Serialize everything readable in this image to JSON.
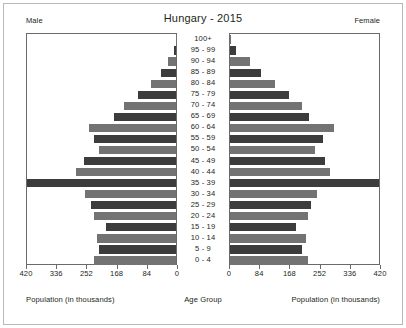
{
  "header": {
    "title": "Hungary - 2015",
    "left_label": "Male",
    "right_label": "Female"
  },
  "captions": {
    "left": "Population (in thousands)",
    "center": "Age Group",
    "right": "Population (in thousands)"
  },
  "axis": {
    "left_ticks": [
      "420",
      "336",
      "252",
      "168",
      "84",
      "0"
    ],
    "right_ticks": [
      "0",
      "84",
      "168",
      "252",
      "336",
      "420"
    ],
    "max": 420,
    "tick_step": 84
  },
  "colors": {
    "bar_dark": "#3c3c3c",
    "bar_light": "#737373",
    "frame": "#6a6a6a",
    "outer_border": "#b9b9b9",
    "background": "#ffffff",
    "text": "#231f20"
  },
  "chart_data": {
    "type": "bar",
    "subtype": "population-pyramid",
    "title": "Hungary - 2015",
    "xlabel": "Population (in thousands)",
    "ylabel": "Age Group",
    "unit": "thousands",
    "xlim": [
      0,
      420
    ],
    "grid": false,
    "legend": [
      "Male",
      "Female"
    ],
    "legend_position": "top-corners",
    "categories": [
      "100+",
      "95 - 99",
      "90 - 94",
      "85 - 89",
      "80 - 84",
      "75 - 79",
      "70 - 74",
      "65 - 69",
      "60 - 64",
      "55 - 59",
      "50 - 54",
      "45 - 49",
      "40 - 44",
      "35 - 39",
      "30 - 34",
      "25 - 29",
      "20 - 24",
      "15 - 19",
      "10 - 14",
      "5 - 9",
      "0 - 4"
    ],
    "series": [
      {
        "name": "Male",
        "side": "left",
        "values": [
          1,
          5,
          22,
          42,
          70,
          107,
          148,
          176,
          246,
          231,
          217,
          258,
          281,
          422,
          257,
          241,
          231,
          198,
          224,
          216,
          232
        ]
      },
      {
        "name": "Female",
        "side": "right",
        "values": [
          4,
          17,
          56,
          88,
          127,
          167,
          204,
          224,
          292,
          263,
          239,
          268,
          283,
          420,
          246,
          228,
          219,
          187,
          213,
          204,
          220
        ]
      }
    ]
  }
}
